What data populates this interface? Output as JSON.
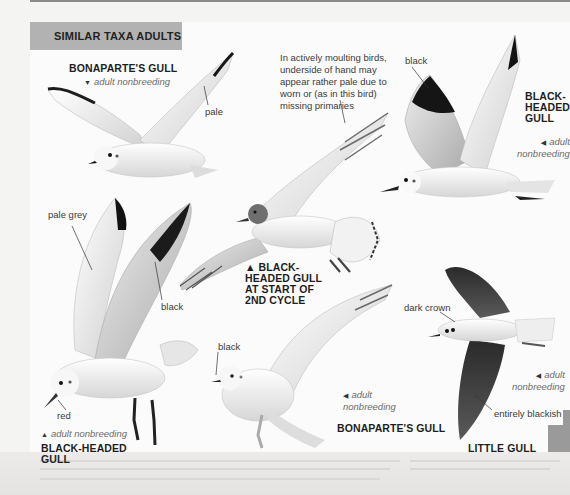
{
  "page": {
    "section_title": "SIMILAR TAXA ADULTS",
    "colors": {
      "header_bar": "#b2b2b2",
      "page_bg": "#fbfbfb",
      "wing_black": "#1a1a1a",
      "pale_grey": "#d8d8d8"
    }
  },
  "plates": [
    {
      "id": "bonaparte-flight-top",
      "species": "BONAPARTE'S GULL",
      "age_arrow": "▼",
      "age": "adult nonbreeding",
      "callouts": [
        "pale"
      ]
    },
    {
      "id": "black-headed-2nd-cycle",
      "species": "▲ BLACK-\nHEADED GULL\nAT START OF\n2ND CYCLE",
      "species_lines": [
        "▲ BLACK-",
        "HEADED GULL",
        "AT START OF",
        "2ND CYCLE"
      ],
      "note": "In actively moulting birds, underside of hand may appear rather pale due to worn or (as in this bird) missing primaries",
      "note_lines": [
        "In actively moulting birds,",
        "underside of hand may",
        "appear rather pale due to",
        "worn or (as in this bird)",
        "missing primaries"
      ]
    },
    {
      "id": "black-headed-top-right",
      "species_lines": [
        "BLACK-",
        "HEADED",
        "GULL"
      ],
      "age_arrow": "◀",
      "age_lines": [
        "adult",
        "nonbreeding"
      ],
      "callouts": [
        "black"
      ]
    },
    {
      "id": "black-headed-landing",
      "species_lines": [
        "BLACK-HEADED",
        "GULL"
      ],
      "age_arrow": "▲",
      "age": "adult nonbreeding",
      "callouts": [
        "pale grey",
        "black",
        "red"
      ]
    },
    {
      "id": "bonaparte-bottom",
      "species": "BONAPARTE'S GULL",
      "age_arrow": "◀",
      "age_lines": [
        "adult",
        "nonbreeding"
      ],
      "callouts": [
        "black"
      ]
    },
    {
      "id": "little-gull",
      "species": "LITTLE GULL",
      "age_arrow": "◀",
      "age_lines": [
        "adult",
        "nonbreeding"
      ],
      "callouts": [
        "dark crown",
        "entirely blackish"
      ]
    }
  ]
}
